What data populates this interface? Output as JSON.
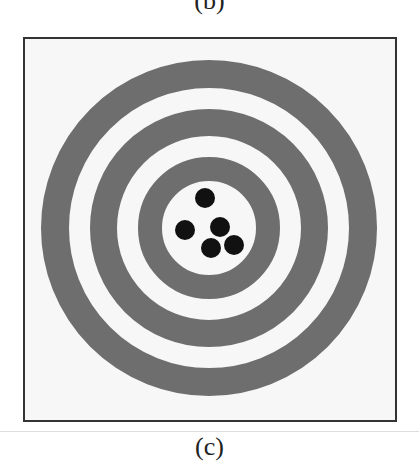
{
  "labels": {
    "top": "(b)",
    "bottom": "(c)"
  },
  "target": {
    "description": "Target with three concentric grey rings and five black shot holes grouped near the center",
    "colors": {
      "ring": "#6e6e6e",
      "background": "#f7f7f7",
      "shot": "#111111",
      "border": "#333333"
    },
    "rings": [
      {
        "outer_radius": 168,
        "inner_radius": 140
      },
      {
        "outer_radius": 119,
        "inner_radius": 92
      },
      {
        "outer_radius": 71,
        "inner_radius": 47
      }
    ],
    "shots": [
      {
        "x": 203,
        "y": 196
      },
      {
        "x": 183,
        "y": 228
      },
      {
        "x": 218,
        "y": 225
      },
      {
        "x": 209,
        "y": 246
      },
      {
        "x": 232,
        "y": 243
      }
    ],
    "shot_count": 5
  }
}
